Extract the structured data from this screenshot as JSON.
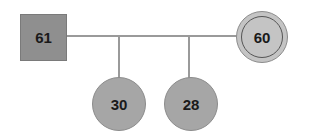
{
  "diagram": {
    "type": "genogram",
    "nodes": [
      {
        "id": "father",
        "shape": "square",
        "label": "61",
        "color": "#8f8f8f"
      },
      {
        "id": "mother",
        "shape": "double-circle",
        "label": "60",
        "color": "#c4c4c4"
      },
      {
        "id": "child1",
        "shape": "circle",
        "label": "30",
        "color": "#a6a6a6"
      },
      {
        "id": "child2",
        "shape": "circle",
        "label": "28",
        "color": "#a6a6a6"
      }
    ],
    "edges": [
      {
        "from": "father",
        "to": "mother",
        "type": "marriage"
      },
      {
        "from": "marriage",
        "to": "child1",
        "type": "child"
      },
      {
        "from": "marriage",
        "to": "child2",
        "type": "child"
      }
    ]
  }
}
